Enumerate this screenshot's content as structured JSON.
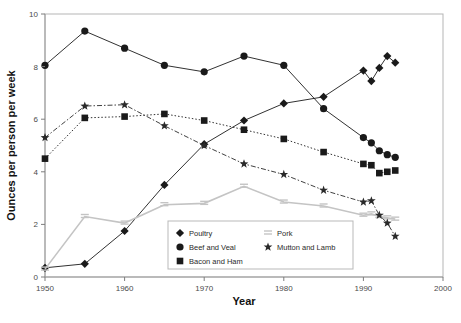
{
  "chart_data": {
    "type": "line",
    "title": "",
    "xlabel": "Year",
    "ylabel": "Ounces per person per week",
    "xlim": [
      1950,
      2000
    ],
    "ylim": [
      0,
      10
    ],
    "xticks": [
      1950,
      1960,
      1970,
      1980,
      1990,
      2000
    ],
    "yticks": [
      0,
      2,
      4,
      6,
      8,
      10
    ],
    "grid": false,
    "legend_position": "bottom-center",
    "series": [
      {
        "name": "Poultry",
        "marker": "diamond",
        "color": "#1a1a1a",
        "linestyle": "solid",
        "x": [
          1950,
          1955,
          1960,
          1965,
          1970,
          1975,
          1980,
          1985,
          1990,
          1991,
          1992,
          1993,
          1994
        ],
        "y": [
          0.35,
          0.5,
          1.75,
          3.5,
          5.05,
          5.95,
          6.6,
          6.85,
          7.85,
          7.45,
          7.95,
          8.4,
          8.15
        ]
      },
      {
        "name": "Beef and Veal",
        "marker": "circle",
        "color": "#1a1a1a",
        "linestyle": "solid",
        "x": [
          1950,
          1955,
          1960,
          1965,
          1970,
          1975,
          1980,
          1985,
          1990,
          1991,
          1992,
          1993,
          1994
        ],
        "y": [
          8.05,
          9.35,
          8.7,
          8.05,
          7.8,
          8.4,
          8.05,
          6.4,
          5.3,
          5.1,
          4.8,
          4.65,
          4.55
        ]
      },
      {
        "name": "Bacon and Ham",
        "marker": "square",
        "color": "#1a1a1a",
        "linestyle": "dotted",
        "x": [
          1950,
          1955,
          1960,
          1965,
          1970,
          1975,
          1980,
          1985,
          1990,
          1991,
          1992,
          1993,
          1994
        ],
        "y": [
          4.5,
          6.05,
          6.1,
          6.2,
          5.95,
          5.6,
          5.25,
          4.75,
          4.3,
          4.25,
          3.95,
          4.0,
          4.05
        ]
      },
      {
        "name": "Pork",
        "marker": "bars",
        "color": "#c4c4c4",
        "linestyle": "solid",
        "x": [
          1950,
          1955,
          1960,
          1965,
          1970,
          1975,
          1980,
          1985,
          1990,
          1991,
          1992,
          1993,
          1994
        ],
        "y": [
          0.3,
          2.3,
          2.05,
          2.75,
          2.8,
          3.45,
          2.85,
          2.7,
          2.35,
          2.4,
          2.3,
          2.25,
          2.2
        ]
      },
      {
        "name": "Mutton and Lamb",
        "marker": "star",
        "color": "#2a2a2a",
        "linestyle": "dashdot",
        "x": [
          1950,
          1955,
          1960,
          1965,
          1970,
          1975,
          1980,
          1985,
          1990,
          1991,
          1992,
          1993,
          1994
        ],
        "y": [
          5.3,
          6.5,
          6.55,
          5.75,
          5.0,
          4.3,
          3.9,
          3.3,
          2.85,
          2.9,
          2.35,
          2.05,
          1.55
        ]
      }
    ],
    "legend_entries": [
      {
        "label": "Poultry",
        "marker": "diamond"
      },
      {
        "label": "Pork",
        "marker": "bars"
      },
      {
        "label": "Beef and Veal",
        "marker": "circle"
      },
      {
        "label": "Mutton and Lamb",
        "marker": "star"
      },
      {
        "label": "Bacon and Ham",
        "marker": "square"
      }
    ]
  },
  "caption": ""
}
